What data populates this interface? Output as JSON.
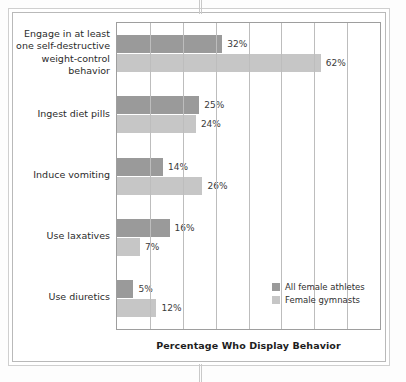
{
  "chart_data": {
    "type": "bar",
    "orientation": "horizontal",
    "title": "",
    "xlabel": "Percentage Who Display Behavior",
    "ylabel": "",
    "xlim": [
      0,
      80
    ],
    "grid": true,
    "gridline_step": 10,
    "legend_position": "inside-bottom-right",
    "value_suffix": "%",
    "categories": [
      "Engage in at least one self-destructive weight-control behavior",
      "Ingest diet pills",
      "Induce vomiting",
      "Use laxatives",
      "Use diuretics"
    ],
    "series": [
      {
        "name": "All female athletes",
        "color": "#9a9a9a",
        "values": [
          32,
          25,
          14,
          16,
          5
        ],
        "labels": [
          "32%",
          "25%",
          "14%",
          "16%",
          "5%"
        ]
      },
      {
        "name": "Female gymnasts",
        "color": "#c6c6c6",
        "values": [
          62,
          24,
          26,
          7,
          12
        ],
        "labels": [
          "62%",
          "24%",
          "26%",
          "7%",
          "12%"
        ]
      }
    ]
  },
  "category_lines": [
    [
      "Engage in at least",
      "one self-destructive",
      "weight-control",
      "behavior"
    ],
    [
      "Ingest diet pills"
    ],
    [
      "Induce vomiting"
    ],
    [
      "Use laxatives"
    ],
    [
      "Use diuretics"
    ]
  ],
  "legend": {
    "items": [
      {
        "label": "All female athletes",
        "swatch": "dark"
      },
      {
        "label": "Female gymnasts",
        "swatch": "light"
      }
    ]
  },
  "axis": {
    "title": "Percentage Who Display Behavior"
  }
}
